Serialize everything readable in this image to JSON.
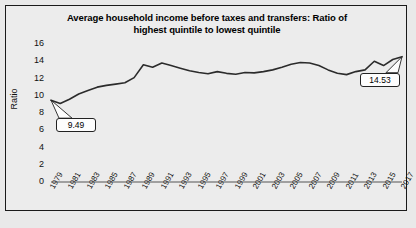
{
  "chart_data": {
    "type": "line",
    "title": "Average household income before taxes and transfers: Ratio of highest quintile to lowest quintile",
    "title_line1": "Average household income before taxes and transfers: Ratio of",
    "title_line2": "highest quintile to lowest quintile",
    "xlabel": "",
    "ylabel": "Ratio",
    "ylim": [
      0,
      16
    ],
    "yticks": [
      0,
      2,
      4,
      6,
      8,
      10,
      12,
      14,
      16
    ],
    "xticks": [
      "1979",
      "1981",
      "1983",
      "1985",
      "1987",
      "1989",
      "1991",
      "1993",
      "1995",
      "1997",
      "1999",
      "2001",
      "2003",
      "2005",
      "2007",
      "2009",
      "2011",
      "2013",
      "2015",
      "2017"
    ],
    "grid": false,
    "legend": false,
    "line_color": "#2b2b2b",
    "x": [
      1979,
      1980,
      1981,
      1982,
      1983,
      1984,
      1985,
      1986,
      1987,
      1988,
      1989,
      1990,
      1991,
      1992,
      1993,
      1994,
      1995,
      1996,
      1997,
      1998,
      1999,
      2000,
      2001,
      2002,
      2003,
      2004,
      2005,
      2006,
      2007,
      2008,
      2009,
      2010,
      2011,
      2012,
      2013,
      2014,
      2015,
      2016,
      2017
    ],
    "values": [
      9.49,
      9.1,
      9.6,
      10.2,
      10.6,
      11.0,
      11.2,
      11.35,
      11.5,
      12.1,
      13.6,
      13.3,
      13.8,
      13.5,
      13.2,
      12.9,
      12.7,
      12.55,
      12.8,
      12.6,
      12.5,
      12.7,
      12.65,
      12.8,
      13.0,
      13.3,
      13.65,
      13.85,
      13.8,
      13.5,
      13.0,
      12.6,
      12.45,
      12.8,
      13.0,
      14.0,
      13.5,
      14.2,
      14.53
    ],
    "annotations": [
      {
        "label": "9.49",
        "year": 1979,
        "value": 9.49
      },
      {
        "label": "14.53",
        "year": 2017,
        "value": 14.53
      }
    ]
  }
}
